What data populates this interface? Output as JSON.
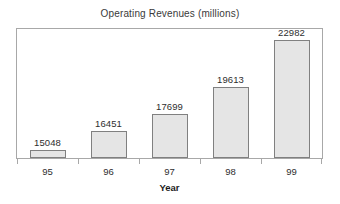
{
  "chart_data": {
    "type": "bar",
    "title": "Operating Revenues (millions)",
    "xlabel": "Year",
    "ylabel": "",
    "categories": [
      "95",
      "96",
      "97",
      "98",
      "99"
    ],
    "values": [
      15048,
      16451,
      17699,
      19613,
      22982
    ],
    "data_labels": [
      "15048",
      "16451",
      "17699",
      "19613",
      "22982"
    ],
    "series": [
      {
        "name": "Operating Revenues",
        "values": [
          15048,
          16451,
          17699,
          19613,
          22982
        ]
      }
    ],
    "ylim": [
      14500,
      23800
    ],
    "y_axis_visible": false,
    "y_tick_labels": [],
    "grid": false,
    "legend": false,
    "legend_position": "none",
    "bar_fill_color": "#e5e5e5",
    "bar_border_color": "#808080",
    "frame_color": "#a8a8a8",
    "background_color": "#ffffff",
    "text_color": "#2e2e2e",
    "annotations": []
  }
}
